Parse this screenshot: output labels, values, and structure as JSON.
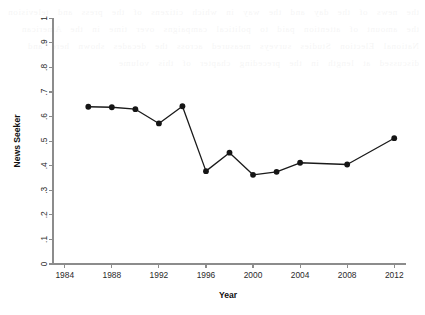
{
  "chart_data": {
    "type": "line",
    "title": "",
    "xlabel": "Year",
    "ylabel": "News Seeker",
    "x": [
      1986,
      1988,
      1990,
      1992,
      1994,
      1996,
      1998,
      2000,
      2002,
      2004,
      2008,
      2012
    ],
    "values": [
      0.64,
      0.638,
      0.63,
      0.572,
      0.642,
      0.378,
      0.453,
      0.363,
      0.375,
      0.412,
      0.405,
      0.512
    ],
    "series": [
      {
        "name": "News Seeker",
        "values": [
          0.64,
          0.638,
          0.63,
          0.572,
          0.642,
          0.378,
          0.453,
          0.363,
          0.375,
          0.412,
          0.405,
          0.512
        ]
      }
    ],
    "xlim": [
      1983,
      2013
    ],
    "ylim": [
      0,
      1
    ],
    "xticks": [
      1984,
      1988,
      1992,
      1996,
      2000,
      2004,
      2008,
      2012
    ],
    "xticklabels": [
      "1984",
      "1988",
      "1992",
      "1996",
      "2000",
      "2004",
      "2008",
      "2012"
    ],
    "yticks": [
      0,
      0.1,
      0.2,
      0.3,
      0.4,
      0.5,
      0.6,
      0.7,
      0.8,
      0.9,
      1
    ],
    "yticklabels": [
      "0",
      ".1",
      ".2",
      ".3",
      ".4",
      ".5",
      ".6",
      ".7",
      ".8",
      ".9",
      "1"
    ],
    "grid": false,
    "legend": "none",
    "marker": "filled-circle",
    "line_color": "#1a1a1a",
    "marker_color": "#151515",
    "axis_color": "#8c8c8c",
    "background_color": "#ffffff",
    "ytick_label_rotation": 90
  },
  "bleed_text": "the news of the day and the way in which citizens of the press and television the amount of attention paid to political campaigns over time in the American National Election Studies surveys measured across the decades shown here and discussed at length in the preceding chapter of this volume"
}
